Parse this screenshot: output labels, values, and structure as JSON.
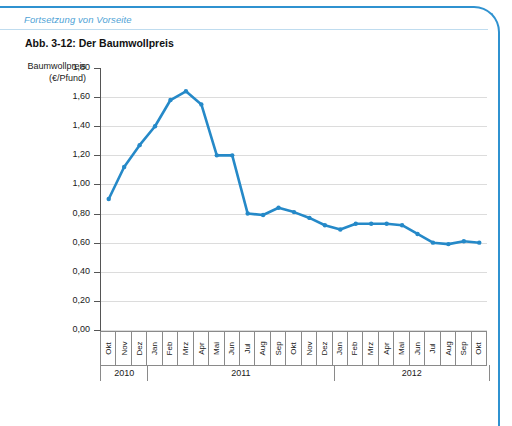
{
  "page": {
    "continued_note": "Fortsetzung von Vorseite",
    "figure_title": "Abb. 3-12: Der Baumwollpreis",
    "accent_color": "#2f92d0",
    "line_color": "#2589c8"
  },
  "chart_data": {
    "type": "line",
    "title": "Abb. 3-12: Der Baumwollpreis",
    "ylabel": "Baumwollpreis (€/Pfund)",
    "ylabel_line1": "Baumwollpreis",
    "ylabel_line2": "(€/Pfund)",
    "xlabel": "",
    "ylim": [
      0.0,
      1.8
    ],
    "ytick_labels": [
      "1,80",
      "1,60",
      "1,40",
      "1,20",
      "1,00",
      "0,80",
      "0,60",
      "0,40",
      "0,20",
      "0,00"
    ],
    "ytick_values": [
      1.8,
      1.6,
      1.4,
      1.2,
      1.0,
      0.8,
      0.6,
      0.4,
      0.2,
      0.0
    ],
    "grid": true,
    "legend": "none",
    "categories": [
      "Okt",
      "Nov",
      "Dez",
      "Jan",
      "Feb",
      "Mrz",
      "Apr",
      "Mai",
      "Jun",
      "Jul",
      "Aug",
      "Sep",
      "Okt",
      "Nov",
      "Dez",
      "Jan",
      "Feb",
      "Mrz",
      "Apr",
      "Mai",
      "Jun",
      "Jul",
      "Aug",
      "Sep",
      "Okt"
    ],
    "year_groups": [
      {
        "label": "2010",
        "months": 3
      },
      {
        "label": "2011",
        "months": 12
      },
      {
        "label": "2012",
        "months": 10
      }
    ],
    "values": [
      0.9,
      1.12,
      1.27,
      1.4,
      1.58,
      1.64,
      1.55,
      1.2,
      1.2,
      0.8,
      0.79,
      0.84,
      0.81,
      0.77,
      0.72,
      0.69,
      0.73,
      0.73,
      0.73,
      0.72,
      0.66,
      0.6,
      0.59,
      0.61,
      0.6
    ],
    "series": [
      {
        "name": "Baumwollpreis",
        "values": [
          0.9,
          1.12,
          1.27,
          1.4,
          1.58,
          1.64,
          1.55,
          1.2,
          1.2,
          0.8,
          0.79,
          0.84,
          0.81,
          0.77,
          0.72,
          0.69,
          0.73,
          0.73,
          0.73,
          0.72,
          0.66,
          0.6,
          0.59,
          0.61,
          0.6
        ]
      }
    ]
  }
}
